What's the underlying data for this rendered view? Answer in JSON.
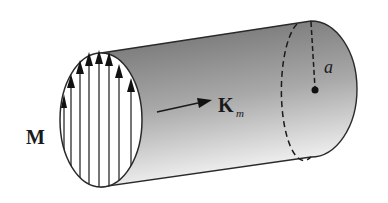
{
  "diagram": {
    "type": "magnetized-cylinder",
    "labels": {
      "magnetization": "M",
      "surface_current": "K",
      "surface_current_subscript": "m",
      "radius": "a"
    },
    "arrow_count": 8,
    "colors": {
      "stroke": "#2a2a2a",
      "shade_dark": "#6f6f6f",
      "shade_light": "#f2f2f2",
      "background": "#ffffff"
    }
  }
}
